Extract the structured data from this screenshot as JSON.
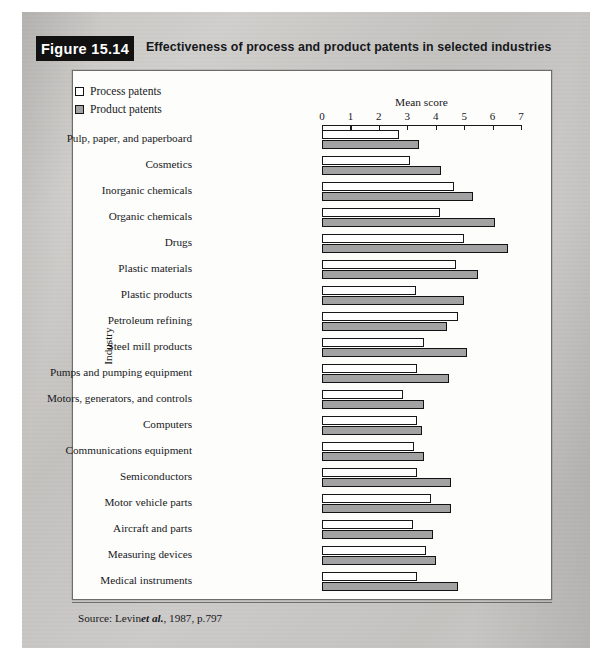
{
  "figure": {
    "tab_label": "Figure 15.14",
    "caption": "Effectiveness of process and product patents in selected industries",
    "source_prefix": "Source: Levin",
    "source_italic": "et al.",
    "source_suffix": ", 1987, p.797"
  },
  "legend": {
    "items": [
      {
        "label": "Process patents",
        "swatch": "white",
        "color": "#ffffff"
      },
      {
        "label": "Product patents",
        "swatch": "grey",
        "color": "#a2a2a2"
      }
    ]
  },
  "chart_data": {
    "type": "bar",
    "orientation": "horizontal",
    "title": "Effectiveness of process and product patents in selected industries",
    "xlabel": "Mean score",
    "ylabel": "Industry",
    "xlim": [
      0,
      7
    ],
    "xticks": [
      0,
      1,
      2,
      3,
      4,
      5,
      6,
      7
    ],
    "grid": false,
    "legend_position": "top-left",
    "categories": [
      "Pulp, paper, and paperboard",
      "Cosmetics",
      "Inorganic chemicals",
      "Organic chemicals",
      "Drugs",
      "Plastic materials",
      "Plastic products",
      "Petroleum refining",
      "Steel mill products",
      "Pumps and pumping equipment",
      "Motors, generators, and controls",
      "Computers",
      "Communications equipment",
      "Semiconductors",
      "Motor vehicle parts",
      "Aircraft and parts",
      "Measuring devices",
      "Medical instruments"
    ],
    "series": [
      {
        "name": "Process patents",
        "color": "#ffffff",
        "values": [
          2.7,
          3.1,
          4.65,
          4.15,
          5.0,
          4.7,
          3.3,
          4.8,
          3.6,
          3.35,
          2.85,
          3.35,
          3.25,
          3.35,
          3.85,
          3.2,
          3.65,
          3.35
        ]
      },
      {
        "name": "Product patents",
        "color": "#a2a2a2",
        "values": [
          3.4,
          4.2,
          5.3,
          6.1,
          6.55,
          5.5,
          5.0,
          4.4,
          5.1,
          4.45,
          3.6,
          3.5,
          3.6,
          4.55,
          4.55,
          3.9,
          4.0,
          4.8
        ]
      }
    ]
  }
}
